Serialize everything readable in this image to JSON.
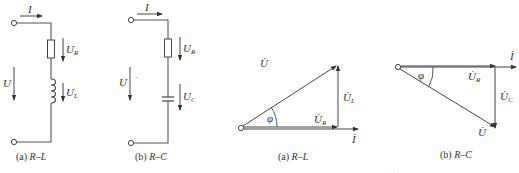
{
  "figure": {
    "circuits": [
      {
        "id": "rl",
        "caption_prefix": "(a) ",
        "caption_label": "R–L",
        "labels": {
          "current": "I",
          "source_voltage": "U",
          "resistor_voltage": "U",
          "resistor_sub": "R",
          "inductor_voltage": "U",
          "inductor_sub": "L"
        },
        "components": [
          "resistor",
          "inductor"
        ]
      },
      {
        "id": "rc",
        "caption_prefix": "(b) ",
        "caption_label": "R–C",
        "labels": {
          "current": "I",
          "source_voltage": "U",
          "source_mark": "·",
          "resistor_voltage": "U",
          "resistor_sub": "R",
          "capacitor_voltage": "U",
          "capacitor_sub": "C"
        },
        "components": [
          "resistor",
          "capacitor"
        ]
      }
    ],
    "phasors": [
      {
        "id": "rl-phasor",
        "caption_prefix": "(a) ",
        "caption_label": "R–L",
        "labels": {
          "total": "U̇",
          "resistive": "U̇",
          "resistive_sub": "R",
          "reactive": "U̇",
          "reactive_sub": "L",
          "current": "İ",
          "angle": "φ"
        }
      },
      {
        "id": "rc-phasor",
        "caption_prefix": "(b) ",
        "caption_label": "R–C",
        "labels": {
          "total": "U̇",
          "resistive": "U̇",
          "resistive_sub": "R",
          "reactive": "U̇",
          "reactive_sub": "C",
          "current": "İ",
          "angle": "φ"
        }
      }
    ],
    "watermark": "· · · ·"
  }
}
